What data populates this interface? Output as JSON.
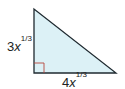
{
  "diagram": {
    "type": "right-triangle",
    "colors": {
      "fill": "#dcf1f6",
      "stroke": "#1f2a30",
      "right_angle_marker": "#b5483d",
      "text": "#222222"
    },
    "vertices": {
      "top": [
        34,
        9
      ],
      "right_angle": [
        34,
        73
      ],
      "right": [
        116,
        73
      ]
    },
    "right_angle_marker_size": 10,
    "labels": {
      "left_side": {
        "coef": "3",
        "var": "x",
        "exp": "1/3"
      },
      "bottom_side": {
        "coef": "4",
        "var": "x",
        "exp": "1/3"
      }
    }
  }
}
